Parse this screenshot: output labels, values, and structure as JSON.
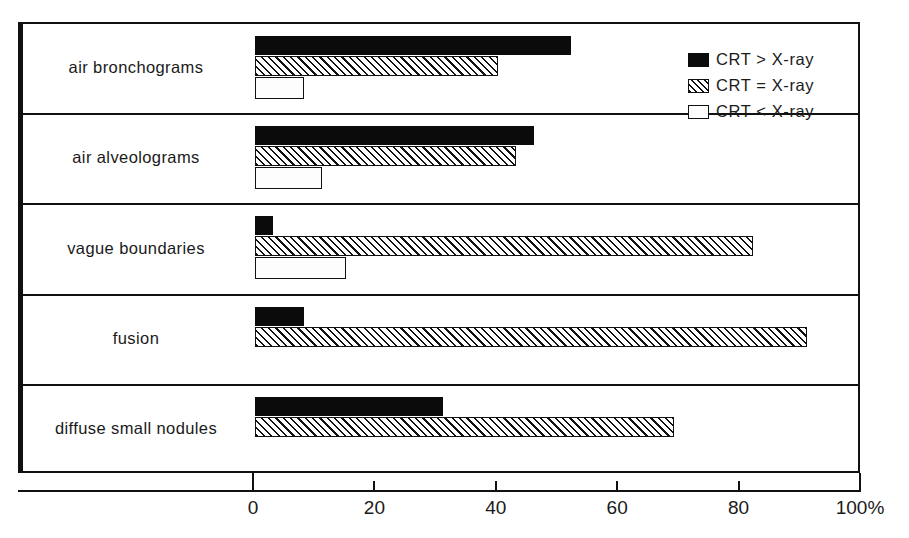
{
  "chart_data": {
    "type": "bar",
    "orientation": "horizontal",
    "title": "",
    "xlabel": "",
    "ylabel": "",
    "xlim": [
      0,
      100
    ],
    "unit": "%",
    "grid": false,
    "legend_position": "top-right",
    "categories": [
      "air bronchograms",
      "air alveolograms",
      "vague boundaries",
      "fusion",
      "diffuse small nodules"
    ],
    "series": [
      {
        "name": "CRT > X-ray",
        "pattern": "solid-black",
        "values": [
          52,
          46,
          3,
          8,
          31
        ]
      },
      {
        "name": "CRT = X-ray",
        "pattern": "diagonal-hatch",
        "values": [
          40,
          43,
          82,
          91,
          69
        ]
      },
      {
        "name": "CRT < X-ray",
        "pattern": "dotted-white",
        "values": [
          8,
          11,
          15,
          0,
          0
        ]
      }
    ],
    "xticks": [
      {
        "value": 0,
        "label": "0"
      },
      {
        "value": 20,
        "label": "20"
      },
      {
        "value": 40,
        "label": "40"
      },
      {
        "value": 60,
        "label": "60"
      },
      {
        "value": 80,
        "label": "80"
      },
      {
        "value": 100,
        "label": "100%"
      }
    ]
  },
  "legend": {
    "items": [
      {
        "label": "CRT > X-ray",
        "swatch": "solid-black-swatch"
      },
      {
        "label": "CRT = X-ray",
        "swatch": "hatched-swatch"
      },
      {
        "label": "CRT < X-ray",
        "swatch": "dotted-swatch"
      }
    ]
  },
  "axis": {
    "x_labels": [
      "0",
      "20",
      "40",
      "60",
      "80",
      "100%"
    ]
  },
  "categories": {
    "0": "air bronchograms",
    "1": "air alveolograms",
    "2": "vague boundaries",
    "3": "fusion",
    "4": "diffuse small nodules"
  }
}
